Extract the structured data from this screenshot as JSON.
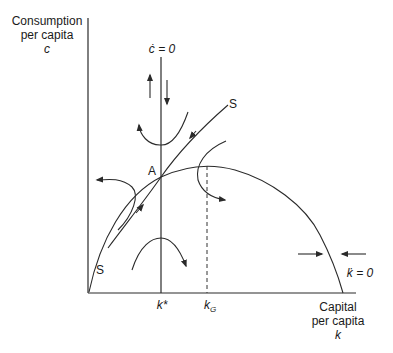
{
  "y_axis": {
    "label_line1": "Consumption",
    "label_line2": "per capita",
    "symbol": "c"
  },
  "x_axis": {
    "label_line1": "Capital",
    "label_line2": "per capita",
    "symbol": "k"
  },
  "loci": {
    "c_dot_zero": "ċ = 0",
    "k_dot_zero": "k̇ = 0"
  },
  "ticks": {
    "k_star": "k*",
    "k_g_base": "k",
    "k_g_sub": "G"
  },
  "points": {
    "steady_state": "A"
  },
  "saddle_path": {
    "upper_label": "S",
    "lower_label": "S"
  },
  "colors": {
    "ink": "#2a2a2a",
    "background": "#ffffff"
  }
}
